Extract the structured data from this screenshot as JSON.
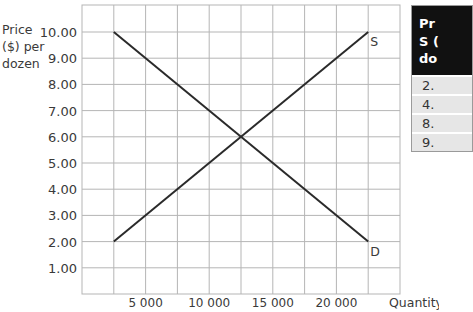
{
  "title_fragment": "…ng supply and…",
  "chart_data": {
    "type": "line",
    "xlabel": "Quantity",
    "ylabel": "Price ($) per dozen",
    "ylabel_lines": [
      "Price",
      "($) per",
      "dozen"
    ],
    "xlim": [
      0,
      25000
    ],
    "ylim": [
      0,
      11
    ],
    "grid": true,
    "x_tick_labels": [
      "5 000",
      "10 000",
      "15 000",
      "20 000"
    ],
    "x_ticks": [
      5000,
      10000,
      15000,
      20000
    ],
    "y_tick_labels": [
      "1.00",
      "2.00",
      "3.00",
      "4.00",
      "5.00",
      "6.00",
      "7.00",
      "8.00",
      "9.00",
      "10.00"
    ],
    "y_ticks": [
      1,
      2,
      3,
      4,
      5,
      6,
      7,
      8,
      9,
      10
    ],
    "series": [
      {
        "name": "S",
        "label": "S",
        "x": [
          2500,
          12500,
          22500
        ],
        "y": [
          2.0,
          6.0,
          10.0
        ]
      },
      {
        "name": "D",
        "label": "D",
        "x": [
          2500,
          12500,
          22500
        ],
        "y": [
          10.0,
          6.0,
          2.0
        ]
      }
    ],
    "equilibrium": {
      "quantity": 12500,
      "price": 6.0
    }
  },
  "side_table": {
    "header_lines": [
      "Pr",
      "S (",
      "do"
    ],
    "rows": [
      "2.",
      "4.",
      "8.",
      "9."
    ]
  }
}
